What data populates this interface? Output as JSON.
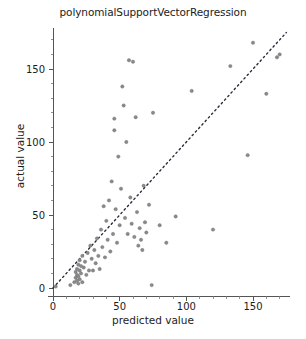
{
  "chart_data": {
    "type": "scatter",
    "title": "polynomialSupportVectorRegression",
    "xlabel": "predicted value",
    "ylabel": "actual value",
    "xlim": [
      -5,
      180
    ],
    "ylim": [
      -8,
      178
    ],
    "xticks": [
      0,
      50,
      100,
      150
    ],
    "yticks": [
      0,
      50,
      100,
      150
    ],
    "xtick_labels": [
      "0",
      "50",
      "100",
      "150"
    ],
    "ytick_labels": [
      "0",
      "50",
      "100",
      "150"
    ],
    "minor_tick_step": 10,
    "grid": false,
    "legend": null,
    "annotations": [],
    "reference_line": {
      "name": "identity-line",
      "style": "dotted",
      "color": "#2b2b3a",
      "x": [
        0,
        175
      ],
      "y": [
        0,
        175
      ]
    },
    "series": [
      {
        "name": "predicted vs actual",
        "marker": "circle",
        "color": "#8a8a8a",
        "points": [
          [
            2,
            1
          ],
          [
            13,
            2
          ],
          [
            16,
            4
          ],
          [
            17,
            7
          ],
          [
            17,
            11
          ],
          [
            18,
            5
          ],
          [
            18,
            9
          ],
          [
            18,
            13
          ],
          [
            19,
            3
          ],
          [
            19,
            8
          ],
          [
            19,
            16
          ],
          [
            20,
            6
          ],
          [
            20,
            12
          ],
          [
            20,
            19
          ],
          [
            21,
            10
          ],
          [
            21,
            15
          ],
          [
            22,
            4
          ],
          [
            22,
            22
          ],
          [
            23,
            14
          ],
          [
            24,
            18
          ],
          [
            25,
            9
          ],
          [
            26,
            24
          ],
          [
            27,
            12
          ],
          [
            28,
            29
          ],
          [
            29,
            20
          ],
          [
            30,
            12
          ],
          [
            31,
            26
          ],
          [
            32,
            17
          ],
          [
            33,
            34
          ],
          [
            34,
            22
          ],
          [
            35,
            13
          ],
          [
            36,
            40
          ],
          [
            37,
            28
          ],
          [
            38,
            56
          ],
          [
            39,
            21
          ],
          [
            40,
            46
          ],
          [
            41,
            33
          ],
          [
            42,
            60
          ],
          [
            43,
            25
          ],
          [
            44,
            73
          ],
          [
            45,
            37
          ],
          [
            46,
            108
          ],
          [
            46,
            116
          ],
          [
            47,
            54
          ],
          [
            48,
            31
          ],
          [
            49,
            90
          ],
          [
            50,
            43
          ],
          [
            51,
            68
          ],
          [
            52,
            138
          ],
          [
            53,
            125
          ],
          [
            54,
            48
          ],
          [
            55,
            100
          ],
          [
            56,
            37
          ],
          [
            57,
            156
          ],
          [
            58,
            62
          ],
          [
            59,
            44
          ],
          [
            60,
            155
          ],
          [
            61,
            35
          ],
          [
            62,
            117
          ],
          [
            63,
            52
          ],
          [
            64,
            29
          ],
          [
            65,
            41
          ],
          [
            66,
            33
          ],
          [
            67,
            26
          ],
          [
            68,
            70
          ],
          [
            69,
            45
          ],
          [
            70,
            38
          ],
          [
            72,
            57
          ],
          [
            74,
            2
          ],
          [
            75,
            120
          ],
          [
            80,
            43
          ],
          [
            85,
            31
          ],
          [
            92,
            49
          ],
          [
            104,
            135
          ],
          [
            120,
            40
          ],
          [
            133,
            152
          ],
          [
            146,
            91
          ],
          [
            150,
            168
          ],
          [
            160,
            133
          ],
          [
            168,
            158
          ],
          [
            170,
            160
          ]
        ]
      }
    ]
  },
  "figure": {
    "background": "#ffffff",
    "point_color": "#8a8a8a",
    "axis_color": "#555555",
    "text_color": "#1c1c1c"
  }
}
